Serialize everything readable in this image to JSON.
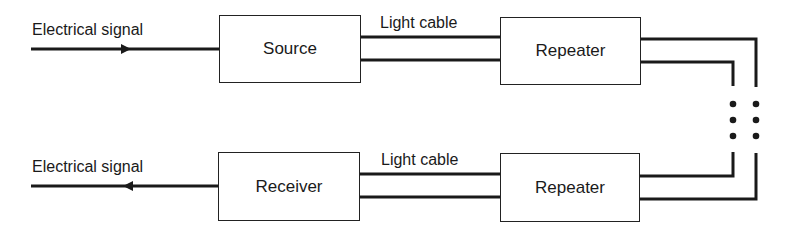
{
  "diagram": {
    "type": "block-diagram",
    "top_row": {
      "input_label": "Electrical signal",
      "source_label": "Source",
      "cable_label": "Light cable",
      "repeater_label": "Repeater"
    },
    "bottom_row": {
      "output_label": "Electrical signal",
      "receiver_label": "Receiver",
      "cable_label": "Light cable",
      "repeater_label": "Repeater"
    },
    "continuation": "ellipsis-dots",
    "colors": {
      "line": "#1a1a1a",
      "background": "#ffffff"
    }
  }
}
